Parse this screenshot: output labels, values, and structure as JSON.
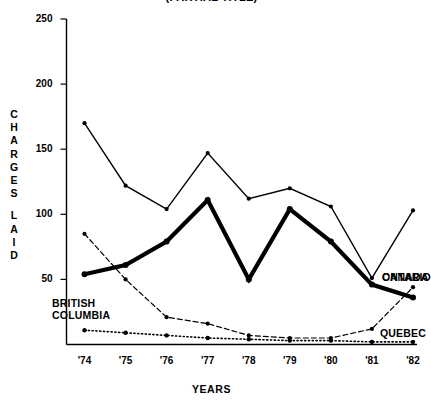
{
  "chart_title": "(PARTIAL TITLE)",
  "axis": {
    "ylabel_letters": [
      "C",
      "H",
      "A",
      "R",
      "G",
      "E",
      "S",
      "",
      "L",
      "A",
      "I",
      "D"
    ],
    "ylabel": "CHARGES LAID",
    "xlabel": "YEARS"
  },
  "labels": {
    "canada": "CANADA",
    "ontario": "ONTARIO",
    "british_columbia_line1": "BRITISH",
    "british_columbia_line2": "COLUMBIA",
    "quebec": "QUEBEC"
  },
  "colors": {
    "ink": "#000000",
    "axis": "#000000"
  },
  "chart_data": {
    "type": "line",
    "title": "(PARTIAL TITLE)",
    "xlabel": "YEARS",
    "ylabel": "CHARGES LAID",
    "categories": [
      "'74",
      "'75",
      "'76",
      "'77",
      "'78",
      "'79",
      "'80",
      "'81",
      "'82"
    ],
    "x": [
      1974,
      1975,
      1976,
      1977,
      1978,
      1979,
      1980,
      1981,
      1982
    ],
    "ylim": [
      0,
      250
    ],
    "yticks": [
      50,
      100,
      150,
      200,
      250
    ],
    "ytick_labels": [
      "50",
      "100",
      "150",
      "200",
      "250"
    ],
    "grid": false,
    "legend": "inline-end-of-line",
    "series": [
      {
        "name": "CANADA",
        "style": "thin-solid",
        "values": [
          170,
          122,
          104,
          147,
          112,
          120,
          106,
          51,
          103
        ]
      },
      {
        "name": "ONTARIO",
        "style": "thick-solid",
        "values": [
          54,
          61,
          79,
          111,
          50,
          104,
          79,
          46,
          36
        ]
      },
      {
        "name": "BRITISH COLUMBIA",
        "style": "dashed",
        "values": [
          85,
          50,
          21,
          16,
          7,
          5,
          5,
          12,
          44
        ]
      },
      {
        "name": "QUEBEC",
        "style": "dotted",
        "values": [
          11,
          9,
          7,
          5,
          4,
          3,
          3,
          2,
          2
        ]
      }
    ]
  }
}
